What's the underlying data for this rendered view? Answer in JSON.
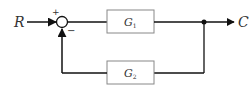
{
  "diagram": {
    "type": "block-diagram",
    "input_label": "R",
    "output_label": "C",
    "summing_junction": {
      "plus_sign": "+",
      "minus_sign": "−"
    },
    "blocks": [
      {
        "id": "forward",
        "label": "G",
        "subscript": "1"
      },
      {
        "id": "feedback",
        "label": "G",
        "subscript": "2"
      }
    ],
    "colors": {
      "line": "#111111",
      "box_stroke": "#888888",
      "text": "#333333",
      "background": "#ffffff"
    }
  }
}
